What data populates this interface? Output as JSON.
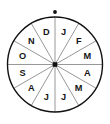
{
  "figure": {
    "name": "month-spinner-wheel",
    "title": "Spinner divided into twelve equal sectors labeled with month initials",
    "background_color": "#ffffff"
  },
  "wheel": {
    "center_x": 55,
    "center_y": 64.5,
    "radius": 47.5,
    "sector_count": 12,
    "sector_angle_degrees": 30,
    "outline_color": "#111111",
    "outline_width": 1.4,
    "spoke_color": "#8c8c8c",
    "spoke_width": 0.9,
    "label_radius": 33.5,
    "direction": "counterclockwise",
    "sectors": [
      {
        "label": "J",
        "month": "January",
        "index": 0,
        "angle_deg": 75
      },
      {
        "label": "F",
        "month": "February",
        "index": 1,
        "angle_deg": 45
      },
      {
        "label": "M",
        "month": "March",
        "index": 2,
        "angle_deg": 15
      },
      {
        "label": "A",
        "month": "April",
        "index": 3,
        "angle_deg": -15
      },
      {
        "label": "M",
        "month": "May",
        "index": 4,
        "angle_deg": -45
      },
      {
        "label": "J",
        "month": "June",
        "index": 5,
        "angle_deg": -75
      },
      {
        "label": "J",
        "month": "July",
        "index": 6,
        "angle_deg": -105
      },
      {
        "label": "A",
        "month": "August",
        "index": 7,
        "angle_deg": -135
      },
      {
        "label": "S",
        "month": "September",
        "index": 8,
        "angle_deg": -165
      },
      {
        "label": "O",
        "month": "October",
        "index": 9,
        "angle_deg": 165
      },
      {
        "label": "N",
        "month": "November",
        "index": 10,
        "angle_deg": 135
      },
      {
        "label": "D",
        "month": "December",
        "index": 11,
        "angle_deg": 105
      }
    ]
  },
  "hub": {
    "shape": "square",
    "size": 4.6,
    "color": "#111111"
  },
  "pointer_dot": {
    "shape": "circle",
    "center_x": 55,
    "center_y": 12,
    "radius": 1.9,
    "color": "#111111"
  }
}
